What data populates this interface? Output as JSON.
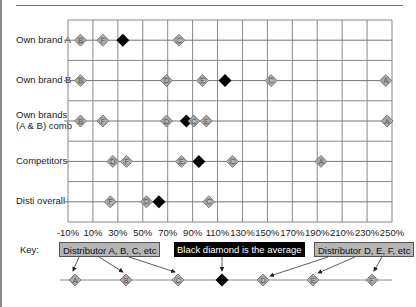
{
  "chart_data": {
    "type": "scatter",
    "title": "",
    "xlabel": "",
    "ylabel": "",
    "xlim": [
      -10,
      250
    ],
    "x_ticks": [
      "-10%",
      "10%",
      "30%",
      "50%",
      "70%",
      "90%",
      "110%",
      "130%",
      "150%",
      "170%",
      "190%",
      "210%",
      "230%",
      "250%"
    ],
    "grid": true,
    "categories": [
      "Own brand A",
      "Own brand B",
      "Own brands (A & B) comb",
      "Competitors",
      "Disti overall"
    ],
    "rows": [
      {
        "label": "Own brand A",
        "label_lines": [
          "Own brand A"
        ],
        "points": [
          {
            "id": "B",
            "x": 0
          },
          {
            "id": "F",
            "x": 18
          },
          {
            "id": "avg",
            "x": 34
          },
          {
            "id": "C",
            "x": 79
          }
        ]
      },
      {
        "label": "Own brand B",
        "label_lines": [
          "Own brand B"
        ],
        "points": [
          {
            "id": "B",
            "x": 0
          },
          {
            "id": "D",
            "x": 69
          },
          {
            "id": "E",
            "x": 98
          },
          {
            "id": "avg",
            "x": 116
          },
          {
            "id": "C",
            "x": 153
          },
          {
            "id": "A",
            "x": 245
          }
        ]
      },
      {
        "label": "Own brands (A & B) comb",
        "label_lines": [
          "Own brands",
          "(A & B) comb"
        ],
        "points": [
          {
            "id": "B",
            "x": 0
          },
          {
            "id": "F",
            "x": 18
          },
          {
            "id": "D",
            "x": 69
          },
          {
            "id": "avg",
            "x": 85
          },
          {
            "id": "C",
            "x": 91
          },
          {
            "id": "E",
            "x": 101
          },
          {
            "id": "A",
            "x": 246
          }
        ]
      },
      {
        "label": "Competitors",
        "label_lines": [
          "Competitors"
        ],
        "points": [
          {
            "id": "D",
            "x": 26
          },
          {
            "id": "F",
            "x": 37
          },
          {
            "id": "E",
            "x": 81
          },
          {
            "id": "avg",
            "x": 95
          },
          {
            "id": "C",
            "x": 122
          },
          {
            "id": "A",
            "x": 193
          }
        ]
      },
      {
        "label": "Disti overall",
        "label_lines": [
          "Disti overall"
        ],
        "points": [
          {
            "id": "F",
            "x": 24
          },
          {
            "id": "D",
            "x": 53
          },
          {
            "id": "avg",
            "x": 63
          },
          {
            "id": "C",
            "x": 103
          }
        ]
      }
    ],
    "legend": {
      "label": "Key:",
      "gray_box_left": "Distributor A, B, C, etc",
      "black_box": "Black diamond is the average",
      "gray_box_right": "Distributor D, E, F, etc",
      "key_points": [
        {
          "id": "A",
          "px": 75
        },
        {
          "id": "B",
          "px": 126
        },
        {
          "id": "C",
          "px": 178
        },
        {
          "id": "avg",
          "px": 222
        },
        {
          "id": "D",
          "px": 263
        },
        {
          "id": "E",
          "px": 313
        },
        {
          "id": "F",
          "px": 372
        }
      ]
    },
    "colors": {
      "marker_fill": "#b8b8b8",
      "marker_stroke": "#666666",
      "average_fill": "#000000",
      "grid": "#888888"
    }
  }
}
